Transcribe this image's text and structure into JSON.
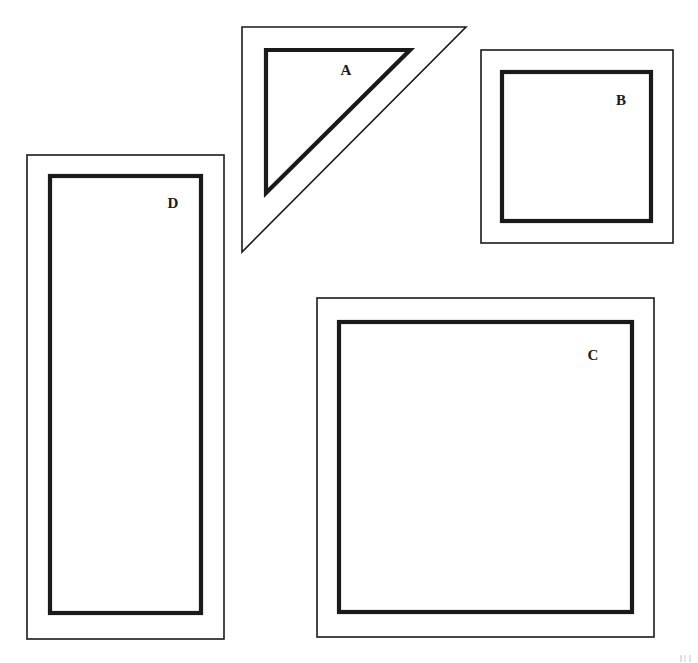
{
  "figure": {
    "background_color": "#ffffff",
    "stroke_color": "#1a1a1a",
    "width": 698,
    "height": 663,
    "shapes": [
      {
        "id": "A",
        "label": "A",
        "kind": "right-triangle",
        "description": "Right triangle with right angle at upper-left, drawn as a thin outer outline with a thicker inner triangle outline",
        "label_position": {
          "x": 346,
          "y": 70
        },
        "outer_points": "242,27 466,27 242,252",
        "inner_points": "266,50 410,50 266,193"
      },
      {
        "id": "B",
        "label": "B",
        "kind": "square",
        "description": "Small square frame: thin outer square with a thicker inner square",
        "label_position": {
          "x": 621,
          "y": 100
        },
        "outer_rect": {
          "x": 481,
          "y": 50,
          "width": 192,
          "height": 193
        },
        "inner_rect": {
          "x": 502,
          "y": 72,
          "width": 149,
          "height": 149
        }
      },
      {
        "id": "C",
        "label": "C",
        "kind": "square",
        "description": "Large square frame: thin outer square with a thicker inner square",
        "label_position": {
          "x": 593,
          "y": 355
        },
        "outer_rect": {
          "x": 317,
          "y": 298,
          "width": 337,
          "height": 339
        },
        "inner_rect": {
          "x": 339,
          "y": 322,
          "width": 293,
          "height": 290
        }
      },
      {
        "id": "D",
        "label": "D",
        "kind": "rectangle",
        "description": "Tall narrow rectangle frame: thin outer rectangle with a thicker inner rectangle",
        "label_position": {
          "x": 173,
          "y": 203
        },
        "outer_rect": {
          "x": 27,
          "y": 155,
          "width": 197,
          "height": 484
        },
        "inner_rect": {
          "x": 50,
          "y": 176,
          "width": 151,
          "height": 437
        }
      }
    ]
  }
}
